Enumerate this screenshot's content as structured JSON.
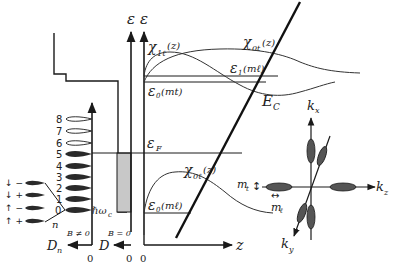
{
  "figure": {
    "type": "band-diagram",
    "colors": {
      "line": "#1a1a1a",
      "filled_level": "#2a2a2a",
      "shaded_dos": "#c8c8c8",
      "background": "#ffffff"
    }
  },
  "landau_dos": {
    "levels": [
      "0",
      "1",
      "2",
      "3",
      "4",
      "5",
      "6",
      "7",
      "8"
    ],
    "filled_levels": [
      "0",
      "1",
      "2",
      "3",
      "4",
      "5"
    ],
    "spin_labels": [
      "↓ −",
      "↓ +",
      "↑ −",
      "↑ +"
    ],
    "index_label": "n",
    "spacing_label": "ℏω",
    "spacing_sub": "c",
    "field_label": "B ≠ 0",
    "axis_label": "D",
    "axis_sub": "n",
    "zero_label": "0"
  },
  "zero_field_dos": {
    "field_label": "B = 0",
    "axis_label": "D",
    "zero_label": "0"
  },
  "axes": {
    "energy_label_1": "ε",
    "energy_label_2": "ε",
    "z_label": "z",
    "origin_label": "0"
  },
  "band": {
    "fermi_label": "ε",
    "fermi_sub": "F",
    "conduction_label": "E",
    "conduction_sub": "C"
  },
  "subbands": {
    "chi_1l": {
      "label": "χ",
      "sub": "1ℓ",
      "arg": "(z)"
    },
    "chi_0t": {
      "label": "χ",
      "sub": "0t",
      "arg": "(z)"
    },
    "chi_0l": {
      "label": "χ",
      "sub": "0ℓ",
      "arg": "(z)"
    },
    "eps1": {
      "label": "ε",
      "sub": "1",
      "arg": "(mℓ)"
    },
    "eps0_upper": {
      "label": "ε",
      "sub": "0",
      "arg": "(mt)"
    },
    "eps0_lower": {
      "label": "ε",
      "sub": "0",
      "arg": "(mℓ)"
    }
  },
  "kspace": {
    "kx": {
      "label": "k",
      "sub": "x"
    },
    "ky": {
      "label": "k",
      "sub": "y"
    },
    "kz": {
      "label": "k",
      "sub": "z"
    },
    "mt": {
      "label": "m",
      "sub": "t",
      "arrow": "↕"
    },
    "ml": {
      "label": "m",
      "sub": "ℓ",
      "arrow": "↔"
    }
  }
}
